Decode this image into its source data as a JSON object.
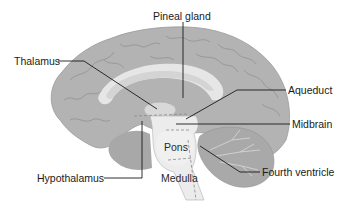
{
  "diagram": {
    "colors": {
      "background": "#ffffff",
      "cortex": "#b3b3b3",
      "cortex_sulci": "#8e8e8e",
      "inner_light": "#e6e6e6",
      "corpus_callosum": "#dcdcdc",
      "brainstem": "#ececec",
      "cerebellum": "#a9a9a9",
      "leader_line": "#1a1a1a",
      "text": "#1a1a1a"
    },
    "labels": [
      {
        "id": "pineal-gland",
        "text": "Pineal gland"
      },
      {
        "id": "thalamus",
        "text": "Thalamus"
      },
      {
        "id": "aqueduct",
        "text": "Aqueduct"
      },
      {
        "id": "midbrain",
        "text": "Midbrain"
      },
      {
        "id": "hypothalamus",
        "text": "Hypothalamus"
      },
      {
        "id": "fourth-ventricle",
        "text": "Fourth ventricle"
      }
    ],
    "inner_labels": [
      {
        "id": "pons",
        "text": "Pons"
      },
      {
        "id": "medulla",
        "text": "Medulla"
      }
    ]
  }
}
